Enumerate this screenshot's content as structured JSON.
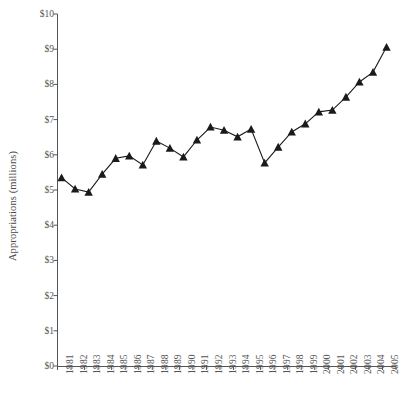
{
  "chart_data": {
    "type": "line",
    "title": "",
    "xlabel": "",
    "ylabel": "Appropriations (millions)",
    "ylim": [
      0,
      10
    ],
    "xlim": [
      1981,
      2005
    ],
    "grid": false,
    "legend": null,
    "marker": "triangle-up",
    "line_color": "#1a1a1a",
    "marker_color": "#1a1a1a",
    "axis_color": "#555555",
    "background": "#ffffff",
    "y_tick_labels": [
      "$0",
      "$1",
      "$2",
      "$3",
      "$4",
      "$5",
      "$6",
      "$7",
      "$8",
      "$9",
      "$10"
    ],
    "y_tick_values": [
      0,
      1,
      2,
      3,
      4,
      5,
      6,
      7,
      8,
      9,
      10
    ],
    "categories": [
      "1981",
      "1982",
      "1983",
      "1984",
      "1985",
      "1986",
      "1987",
      "1988",
      "1989",
      "1990",
      "1991",
      "1992",
      "1993",
      "1994",
      "1995",
      "1996",
      "1997",
      "1998",
      "1999",
      "2000",
      "2001",
      "2002",
      "2003",
      "2004",
      "2005"
    ],
    "x": [
      1981,
      1982,
      1983,
      1984,
      1985,
      1986,
      1987,
      1988,
      1989,
      1990,
      1991,
      1992,
      1993,
      1994,
      1995,
      1996,
      1997,
      1998,
      1999,
      2000,
      2001,
      2002,
      2003,
      2004,
      2005
    ],
    "values": [
      5.35,
      5.03,
      4.94,
      5.45,
      5.9,
      5.97,
      5.71,
      6.39,
      6.19,
      5.94,
      6.42,
      6.79,
      6.7,
      6.51,
      6.73,
      5.77,
      6.22,
      6.65,
      6.88,
      7.22,
      7.27,
      7.64,
      8.07,
      8.35,
      9.06
    ],
    "series": [
      {
        "name": "Appropriations",
        "values": [
          5.35,
          5.03,
          4.94,
          5.45,
          5.9,
          5.97,
          5.71,
          6.39,
          6.19,
          5.94,
          6.42,
          6.79,
          6.7,
          6.51,
          6.73,
          5.77,
          6.22,
          6.65,
          6.88,
          7.22,
          7.27,
          7.64,
          8.07,
          8.35,
          9.06
        ]
      }
    ]
  }
}
